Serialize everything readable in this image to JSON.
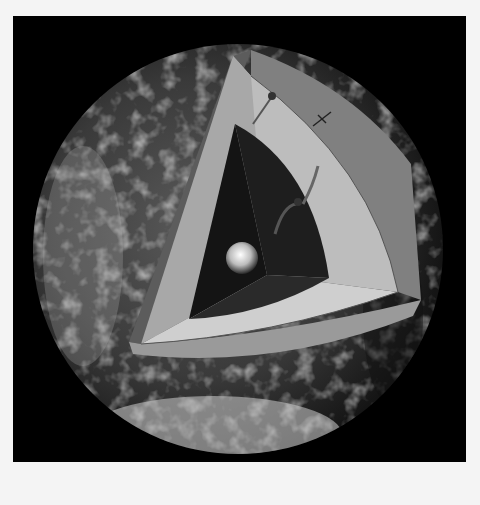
{
  "figure": {
    "caption_fragment": "",
    "layers": [
      {
        "name": "crust",
        "color": "#7a7a7a"
      },
      {
        "name": "mantle",
        "color": "#bdbdbd"
      },
      {
        "name": "outer-core",
        "color": "#1e1e1e"
      },
      {
        "name": "inner-core",
        "color": "#e8e8e8"
      }
    ],
    "background": "#000000"
  }
}
